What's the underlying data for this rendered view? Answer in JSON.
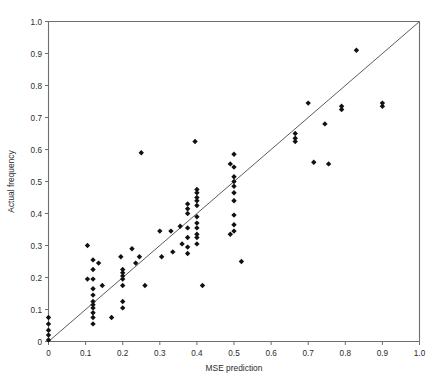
{
  "chart_data": {
    "type": "scatter",
    "title": "",
    "xlabel": "MSE prediction",
    "ylabel": "Actual frequency",
    "xlim": [
      0,
      1.0
    ],
    "ylim": [
      0,
      1.0
    ],
    "grid": false,
    "legend": null,
    "marker": "diamond",
    "marker_color": "#111111",
    "axis_color": "#6e6e6e",
    "reference_line": {
      "name": "identity-line",
      "label": "y = x",
      "x": [
        0,
        1.0
      ],
      "y": [
        0,
        1.0
      ],
      "color": "#4a4a4a"
    },
    "xticks": [
      0,
      0.1,
      0.2,
      0.3,
      0.4,
      0.5,
      0.6,
      0.7,
      0.8,
      0.9,
      1.0
    ],
    "xtick_labels": [
      "0",
      "0.1",
      "0.2",
      "0.3",
      "0.4",
      "0.5",
      "0.6",
      "0.7",
      "0.8",
      "0.9",
      "1.0"
    ],
    "yticks": [
      0,
      0.1,
      0.2,
      0.3,
      0.4,
      0.5,
      0.6,
      0.7,
      0.8,
      0.9,
      1.0
    ],
    "ytick_labels": [
      "0",
      "0.1",
      "0.2",
      "0.3",
      "0.4",
      "0.5",
      "0.6",
      "0.7",
      "0.8",
      "0.9",
      "1.0"
    ],
    "points": [
      [
        0.0,
        0.005
      ],
      [
        0.0,
        0.02
      ],
      [
        0.0,
        0.035
      ],
      [
        0.0,
        0.055
      ],
      [
        0.0,
        0.075
      ],
      [
        0.105,
        0.3
      ],
      [
        0.105,
        0.195
      ],
      [
        0.12,
        0.255
      ],
      [
        0.12,
        0.225
      ],
      [
        0.12,
        0.195
      ],
      [
        0.12,
        0.165
      ],
      [
        0.12,
        0.145
      ],
      [
        0.12,
        0.125
      ],
      [
        0.12,
        0.115
      ],
      [
        0.12,
        0.105
      ],
      [
        0.12,
        0.09
      ],
      [
        0.12,
        0.075
      ],
      [
        0.12,
        0.055
      ],
      [
        0.135,
        0.245
      ],
      [
        0.145,
        0.175
      ],
      [
        0.17,
        0.075
      ],
      [
        0.195,
        0.265
      ],
      [
        0.2,
        0.225
      ],
      [
        0.2,
        0.215
      ],
      [
        0.2,
        0.205
      ],
      [
        0.2,
        0.195
      ],
      [
        0.2,
        0.175
      ],
      [
        0.2,
        0.125
      ],
      [
        0.2,
        0.105
      ],
      [
        0.225,
        0.29
      ],
      [
        0.235,
        0.245
      ],
      [
        0.245,
        0.265
      ],
      [
        0.25,
        0.59
      ],
      [
        0.26,
        0.175
      ],
      [
        0.3,
        0.345
      ],
      [
        0.305,
        0.265
      ],
      [
        0.33,
        0.345
      ],
      [
        0.335,
        0.28
      ],
      [
        0.355,
        0.36
      ],
      [
        0.36,
        0.305
      ],
      [
        0.375,
        0.43
      ],
      [
        0.375,
        0.415
      ],
      [
        0.375,
        0.4
      ],
      [
        0.375,
        0.355
      ],
      [
        0.375,
        0.325
      ],
      [
        0.375,
        0.295
      ],
      [
        0.375,
        0.275
      ],
      [
        0.395,
        0.625
      ],
      [
        0.4,
        0.475
      ],
      [
        0.4,
        0.465
      ],
      [
        0.4,
        0.45
      ],
      [
        0.4,
        0.44
      ],
      [
        0.4,
        0.425
      ],
      [
        0.4,
        0.39
      ],
      [
        0.4,
        0.37
      ],
      [
        0.4,
        0.355
      ],
      [
        0.4,
        0.335
      ],
      [
        0.4,
        0.325
      ],
      [
        0.4,
        0.305
      ],
      [
        0.415,
        0.175
      ],
      [
        0.49,
        0.555
      ],
      [
        0.49,
        0.335
      ],
      [
        0.5,
        0.585
      ],
      [
        0.5,
        0.545
      ],
      [
        0.5,
        0.515
      ],
      [
        0.5,
        0.5
      ],
      [
        0.5,
        0.485
      ],
      [
        0.5,
        0.465
      ],
      [
        0.5,
        0.44
      ],
      [
        0.5,
        0.395
      ],
      [
        0.5,
        0.365
      ],
      [
        0.5,
        0.345
      ],
      [
        0.52,
        0.25
      ],
      [
        0.665,
        0.65
      ],
      [
        0.665,
        0.635
      ],
      [
        0.665,
        0.625
      ],
      [
        0.7,
        0.745
      ],
      [
        0.715,
        0.56
      ],
      [
        0.745,
        0.68
      ],
      [
        0.755,
        0.555
      ],
      [
        0.79,
        0.735
      ],
      [
        0.79,
        0.725
      ],
      [
        0.83,
        0.91
      ],
      [
        0.9,
        0.745
      ],
      [
        0.9,
        0.735
      ]
    ]
  }
}
